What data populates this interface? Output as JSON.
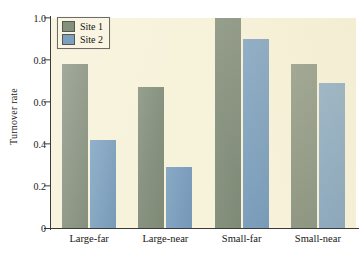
{
  "chart_data": {
    "type": "bar",
    "title": "",
    "xlabel": "",
    "ylabel": "Turnover rate",
    "categories": [
      "Large-far",
      "Large-near",
      "Small-far",
      "Small-near"
    ],
    "series": [
      {
        "name": "Site 1",
        "color": "#85907c",
        "values": [
          0.78,
          0.67,
          1.0,
          0.78
        ]
      },
      {
        "name": "Site 2",
        "color": "#7ba0c0",
        "values": [
          0.42,
          0.29,
          0.9,
          0.69
        ]
      }
    ],
    "ylim": [
      0,
      1.0
    ],
    "yticks": [
      "0",
      "0.2",
      "0.4",
      "0.6",
      "0.8",
      "1.0"
    ],
    "ytick_values": [
      0,
      0.2,
      0.4,
      0.6,
      0.8,
      1.0
    ],
    "grid": false,
    "legend_position": "top-left",
    "plot_background": "#f7f2da",
    "figure_background": "#ffffff"
  },
  "legend": {
    "entries": [
      {
        "label": "Site 1"
      },
      {
        "label": "Site 2"
      }
    ]
  }
}
